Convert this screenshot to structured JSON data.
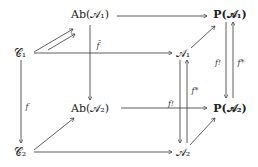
{
  "nodes": {
    "ab1": "Ab(𝒜₁)",
    "p1": "P(𝒜₁)",
    "c1": "𝒞₁",
    "a1": "𝒜₁",
    "ab2": "Ab(𝒜₂)",
    "p2": "P(𝒜₂)",
    "c2": "𝒞₂",
    "a2": "𝒜₂"
  },
  "labels": {
    "f": "f",
    "f_bar": "f̄",
    "f_shriek_left": "f!",
    "f_star_left": "f*",
    "f_shriek_right": "f!",
    "f_star_right": "f*"
  },
  "colors": {
    "line": "#333333",
    "text": "#222222"
  }
}
